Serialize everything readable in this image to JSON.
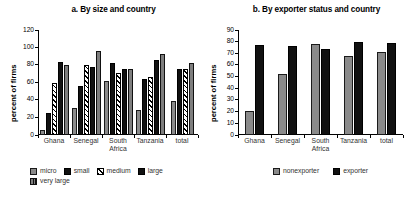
{
  "chart_data": [
    {
      "type": "bar",
      "panel_id": "a",
      "title": "a. By size and country",
      "xlabel": "",
      "ylabel": "percent of firms",
      "ylim": [
        0,
        120
      ],
      "ytick_step": 20,
      "yticks": [
        "120",
        "100",
        "80",
        "60",
        "40",
        "20",
        "0"
      ],
      "grid": false,
      "legend_position": "bottom-left",
      "categories": [
        "Ghana",
        "Senegal",
        "South Africa",
        "Tanzania",
        "total"
      ],
      "category_lines": [
        [
          "Ghana"
        ],
        [
          "Senegal"
        ],
        [
          "South",
          "Africa"
        ],
        [
          "Tanzania"
        ],
        [
          "total"
        ]
      ],
      "series": [
        {
          "name": "micro",
          "fill": "gray",
          "values": [
            6,
            31,
            62,
            29,
            39
          ]
        },
        {
          "name": "small",
          "fill": "black",
          "values": [
            25,
            56,
            82,
            64,
            75
          ]
        },
        {
          "name": "medium",
          "fill": "hatch",
          "values": [
            60,
            80,
            71,
            66,
            75
          ]
        },
        {
          "name": "large",
          "fill": "black",
          "values": [
            83,
            78,
            76,
            86,
            null
          ]
        },
        {
          "name": "very large",
          "fill": "vlarge",
          "values": [
            80,
            96,
            76,
            93,
            82
          ]
        }
      ]
    },
    {
      "type": "bar",
      "panel_id": "b",
      "title": "b. By exporter status and country",
      "xlabel": "",
      "ylabel": "percent of firms",
      "ylim": [
        0,
        90
      ],
      "ytick_step": 10,
      "yticks": [
        "90",
        "80",
        "70",
        "60",
        "50",
        "40",
        "30",
        "20",
        "10",
        "0"
      ],
      "grid": false,
      "legend_position": "bottom-center",
      "categories": [
        "Ghana",
        "Senegal",
        "South Africa",
        "Tanzania",
        "total"
      ],
      "category_lines": [
        [
          "Ghana"
        ],
        [
          "Senegal"
        ],
        [
          "South",
          "Africa"
        ],
        [
          "Tanzania"
        ],
        [
          "total"
        ]
      ],
      "series": [
        {
          "name": "nonexporter",
          "fill": "gray",
          "values": [
            21,
            52,
            78,
            68,
            71
          ]
        },
        {
          "name": "exporter",
          "fill": "black",
          "values": [
            77,
            76,
            73.5,
            80,
            79
          ]
        }
      ]
    }
  ],
  "colors": {
    "gray": "#8a8a8a",
    "black": "#111111",
    "hatch_line": "#000000",
    "hatch_bg": "#ffffff",
    "very_large": "#7e7e7e",
    "axis": "#000000",
    "text": "#333333"
  }
}
